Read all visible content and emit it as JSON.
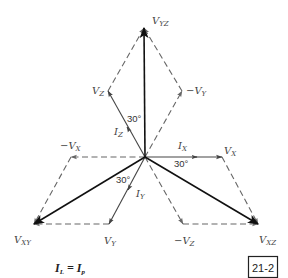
{
  "figure": {
    "type": "phasor-diagram",
    "origin": [
      145,
      157
    ],
    "colors": {
      "line_voltage": "#111111",
      "phase_vector": "#444444",
      "construction": "#666666",
      "label": "#444444"
    },
    "line_voltages": [
      {
        "id": "VYZ",
        "label": "V",
        "sub": "YZ",
        "tip": [
          144,
          28
        ],
        "label_pos": [
          152,
          24
        ]
      },
      {
        "id": "VXY",
        "label": "V",
        "sub": "XY",
        "tip": [
          34,
          224
        ],
        "label_pos": [
          14,
          243
        ]
      },
      {
        "id": "VXZ",
        "label": "V",
        "sub": "XZ",
        "tip": [
          258,
          224
        ],
        "label_pos": [
          259,
          243
        ]
      }
    ],
    "phase_voltages": [
      {
        "id": "VZ",
        "label": "V",
        "sub": "Z",
        "tip": [
          108,
          91
        ],
        "label_pos": [
          92,
          94
        ]
      },
      {
        "id": "VY",
        "label": "V",
        "sub": "Y",
        "tip": [
          109,
          224
        ],
        "label_pos": [
          104,
          244
        ]
      },
      {
        "id": "VX",
        "label": "V",
        "sub": "X",
        "tip": [
          222,
          157
        ],
        "label_pos": [
          224,
          154
        ]
      }
    ],
    "negated_voltages": [
      {
        "id": "negVY",
        "label": "−V",
        "sub": "Y",
        "tip": [
          182,
          91
        ],
        "label_pos": [
          186,
          94
        ]
      },
      {
        "id": "negVX",
        "label": "−V",
        "sub": "X",
        "tip": [
          71,
          157
        ],
        "label_pos": [
          60,
          149
        ]
      },
      {
        "id": "negVZ",
        "label": "−V",
        "sub": "Z",
        "tip": [
          183,
          224
        ],
        "label_pos": [
          174,
          244
        ]
      }
    ],
    "currents": [
      {
        "id": "IZ",
        "label": "I",
        "sub": "Z",
        "arrow_at": [
          127,
          127
        ],
        "label_pos": [
          114,
          135
        ]
      },
      {
        "id": "IY",
        "label": "I",
        "sub": "Y",
        "arrow_at": [
          128,
          190
        ],
        "label_pos": [
          136,
          197
        ]
      },
      {
        "id": "IX",
        "label": "I",
        "sub": "X",
        "arrow_at": [
          197,
          157
        ],
        "label_pos": [
          178,
          149
        ]
      }
    ],
    "angle_labels": [
      {
        "text": "30°",
        "pos": [
          127,
          122
        ]
      },
      {
        "text": "30°",
        "pos": [
          174,
          167
        ]
      },
      {
        "text": "30°",
        "pos": [
          116,
          183
        ]
      }
    ]
  },
  "equation": {
    "lhs": "I",
    "lhs_sub": "L",
    "op": " = ",
    "rhs": "I",
    "rhs_sub": "p"
  },
  "figure_number": "21-2"
}
